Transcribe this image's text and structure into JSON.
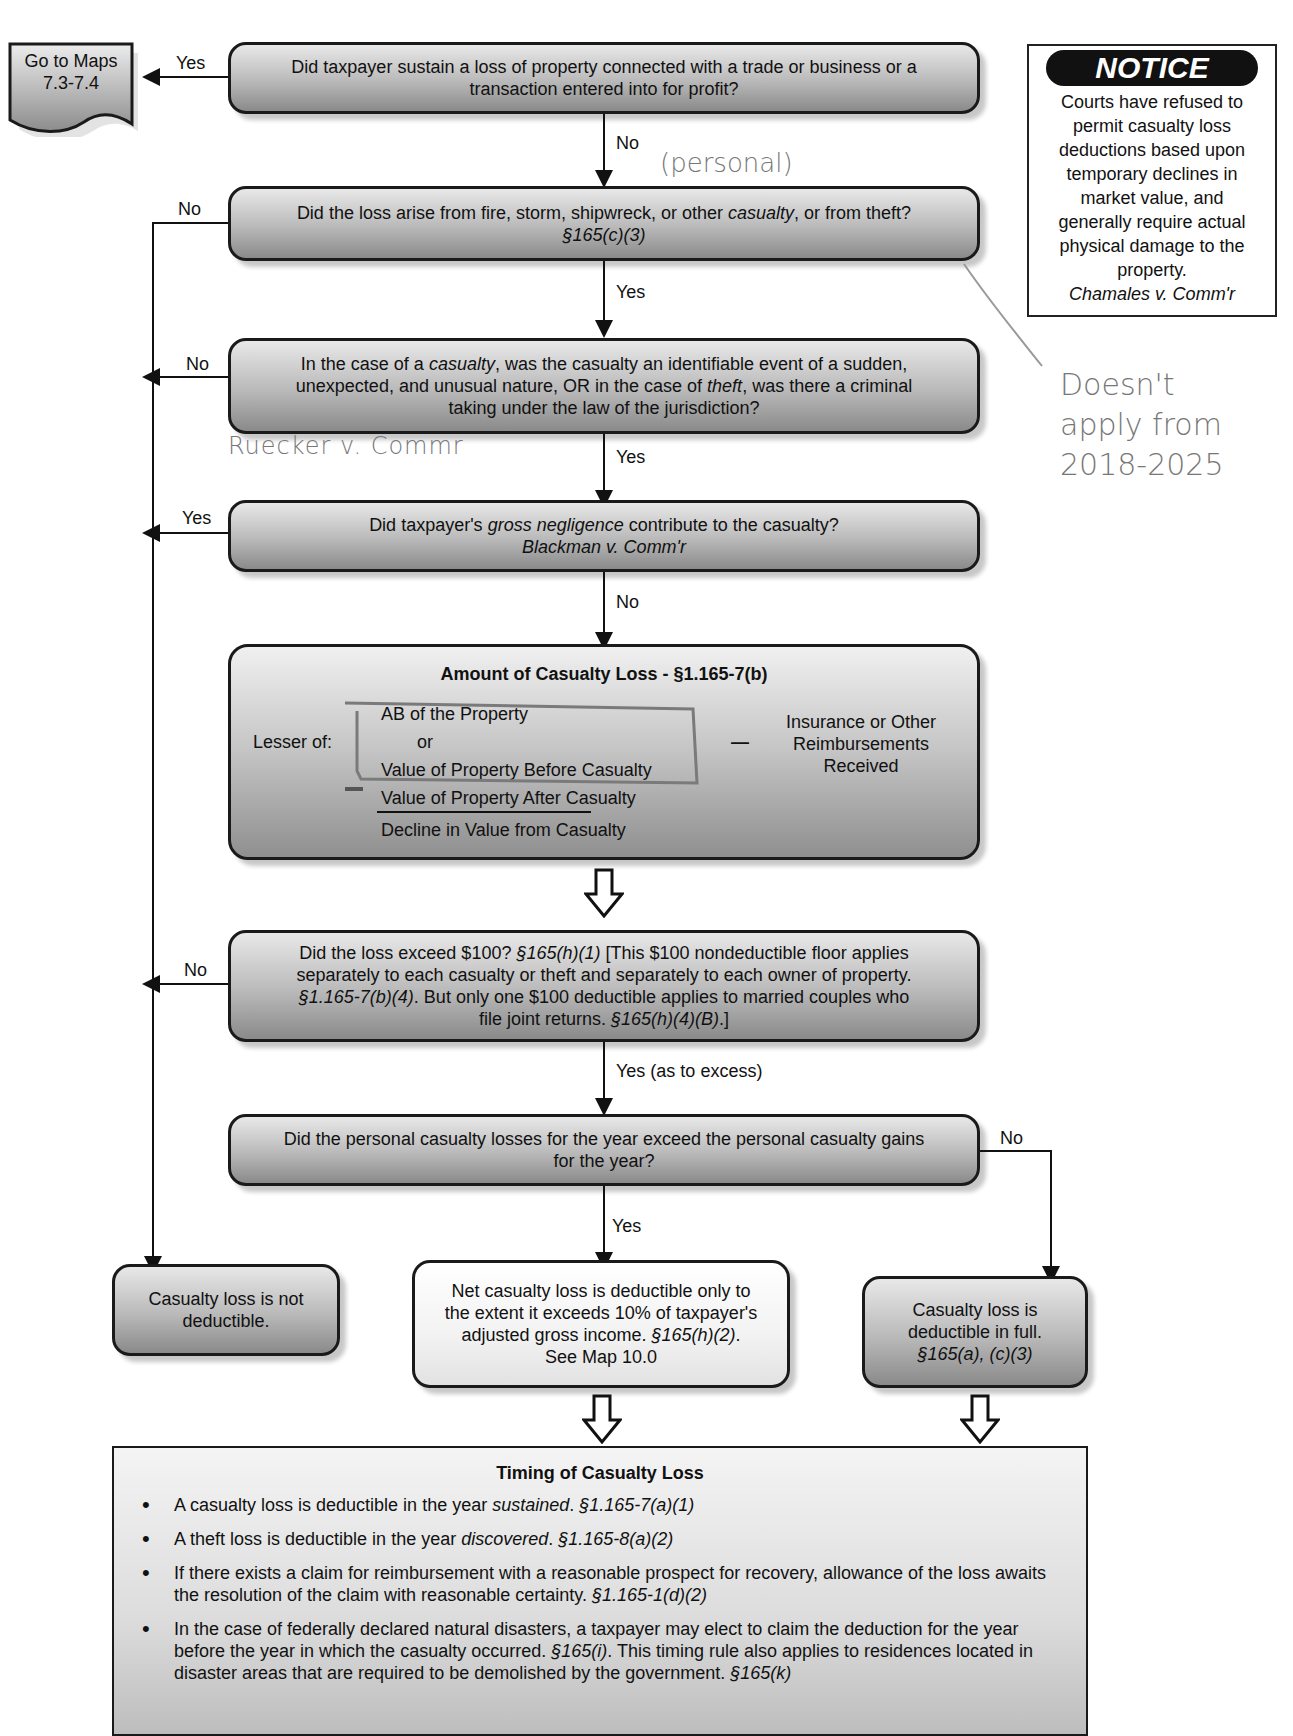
{
  "goto_box": {
    "line1": "Go to Maps",
    "line2": "7.3-7.4"
  },
  "notice": {
    "title": "NOTICE",
    "lines": [
      "Courts have refused to",
      "permit casualty loss",
      "deductions based upon",
      "temporary declines in",
      "market value, and",
      "generally require actual",
      "physical damage to the",
      "property."
    ],
    "citation": "Chamales v. Comm'r"
  },
  "q1": {
    "text_line1": "Did taxpayer sustain a loss of property connected with a trade or business or a",
    "text_line2": "transaction entered into for profit?",
    "yes_label": "Yes",
    "no_label": "No"
  },
  "q2": {
    "text_a": "Did the loss arise from fire, storm, shipwreck, or other ",
    "text_em": "casualty",
    "text_b": ", or from theft?",
    "citation": "§165(c)(3)",
    "no_label": "No",
    "yes_label": "Yes"
  },
  "q3": {
    "l1a": "In the case of a ",
    "l1em": "casualty",
    "l1b": ", was the casualty an identifiable event of a sudden,",
    "l2a": "unexpected, and unusual nature, OR in the case of ",
    "l2em": "theft",
    "l2b": ", was there a criminal",
    "l3": "taking under the law of the jurisdiction?",
    "no_label": "No",
    "yes_label": "Yes"
  },
  "q4": {
    "l1a": "Did taxpayer's ",
    "l1em": "gross negligence",
    "l1b": " contribute to the casualty?",
    "citation": "Blackman v. Comm'r",
    "yes_label": "Yes",
    "no_label": "No"
  },
  "amount": {
    "title": "Amount of Casualty Loss - §1.165-7(b)",
    "lesser_of": "Lesser of:",
    "ab": "AB of the Property",
    "or": "or",
    "before": "Value of Property Before Casualty",
    "after": "Value of Property After Casualty",
    "decline": "Decline in Value from Casualty",
    "minus": "—",
    "reimb_l1": "Insurance or Other",
    "reimb_l2": "Reimbursements",
    "reimb_l3": "Received"
  },
  "q5": {
    "l1a": "Did the loss exceed $100?  ",
    "l1cite": "§165(h)(1)",
    "l1b": "  [This $100 nondeductible floor applies",
    "l2": "separately to each casualty or theft and separately to each owner of property.",
    "l3cite": "§1.165-7(b)(4)",
    "l3b": ".  But only one $100 deductible applies to married couples who",
    "l4a": "file joint returns.  ",
    "l4cite": "§165(h)(4)(B)",
    "l4b": ".]",
    "no_label": "No",
    "yes_label": "Yes (as to excess)"
  },
  "q6": {
    "l1": "Did the personal casualty losses for the year exceed the personal casualty gains",
    "l2": "for the year?",
    "no_label": "No",
    "yes_label": "Yes"
  },
  "outcomes": {
    "not_deductible": {
      "l1": "Casualty loss is not",
      "l2": "deductible."
    },
    "agi_limited": {
      "l1": "Net casualty loss is deductible only to",
      "l2": "the extent it exceeds 10% of taxpayer's",
      "l3a": "adjusted gross income.  ",
      "l3cite": "§165(h)(2)",
      "l3b": ".",
      "l4": "See Map 10.0"
    },
    "full": {
      "l1": "Casualty loss is",
      "l2": "deductible in full.",
      "cite": "§165(a), (c)(3)"
    }
  },
  "timing": {
    "title": "Timing of Casualty Loss",
    "bullets": [
      {
        "a": "A casualty loss is deductible in the year ",
        "em": "sustained",
        "b": ".  ",
        "cite": "§1.165-7(a)(1)",
        "c": ""
      },
      {
        "a": "A theft loss is deductible in the year ",
        "em": "discovered",
        "b": ".  ",
        "cite": "§1.165-8(a)(2)",
        "c": ""
      },
      {
        "a": "If there exists a claim for reimbursement with a reasonable prospect for recovery, allowance of the loss awaits the resolution of the claim with reasonable certainty.  ",
        "em": "",
        "b": "",
        "cite": "§1.165-1(d)(2)",
        "c": ""
      },
      {
        "a": "In the case of federally declared natural disasters, a taxpayer may elect to claim the deduction for the year before the year in which the casualty occurred.  ",
        "em": "",
        "b": "",
        "cite": "§165(i)",
        "c": ".  This timing rule also applies to residences located in disaster areas that are required to be demolished by the government. ",
        "cite2": "§165(k)"
      }
    ]
  },
  "annotations": {
    "personal": "(personal)",
    "rueckert": "Ruecker v. Commr",
    "note_l1": "Doesn't",
    "note_l2": "apply from",
    "note_l3": "2018-2025"
  }
}
